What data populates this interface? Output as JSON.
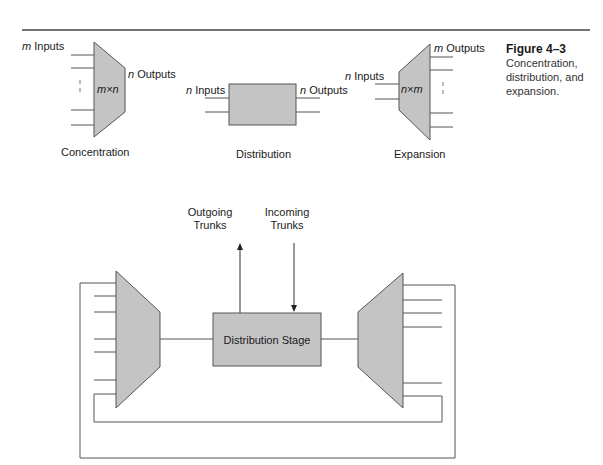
{
  "figure": {
    "number": "Figure 4–3",
    "caption_lines": [
      "Concentration,",
      "distribution, and",
      "expansion."
    ]
  },
  "top_diagram": {
    "concentration": {
      "inputs_var": "m",
      "inputs_label": " Inputs",
      "outputs_var": "n",
      "outputs_label": " Outputs",
      "inner_label": "m×n",
      "caption": "Concentration"
    },
    "distribution": {
      "inputs_var": "n",
      "inputs_label": " Inputs",
      "outputs_var": "n",
      "outputs_label": " Outputs",
      "caption": "Distribution"
    },
    "expansion": {
      "inputs_var": "n",
      "inputs_label": " Inputs",
      "outputs_var": "m",
      "outputs_label": " Outputs",
      "inner_label": "n×m",
      "caption": "Expansion"
    }
  },
  "bottom_diagram": {
    "outgoing": [
      "Outgoing",
      "Trunks"
    ],
    "incoming": [
      "Incoming",
      "Trunks"
    ],
    "center_label": "Distribution Stage"
  },
  "colors": {
    "fill": "#c4c4c4",
    "stroke": "#555555"
  }
}
